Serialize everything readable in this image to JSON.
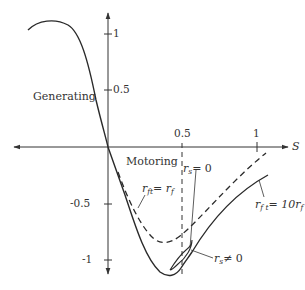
{
  "diagram": {
    "type": "torque-slip characteristic",
    "axes": {
      "x_label": "S",
      "x_ticks": [
        "0.5",
        "1"
      ],
      "y_ticks": [
        "1",
        "0.5",
        "-0.5",
        "-1"
      ]
    },
    "regions": {
      "generating": "Generating",
      "motoring": "Motoring"
    },
    "annotations": {
      "rs_zero": {
        "var": "r",
        "sub": "s",
        "rel": "= 0"
      },
      "rs_nonzero": {
        "var": "r",
        "sub": "s",
        "rel": "≠ 0"
      },
      "rft_eq_rf": {
        "var": "r",
        "sub": "ft",
        "rel": "= r",
        "sub2": "f"
      },
      "rft_eq_10rf": {
        "var": "r",
        "sub": "f t",
        "rel": "= 10r",
        "sub2": "f"
      }
    },
    "colors": {
      "line": "#2a2a2a",
      "axis": "#333333",
      "text": "#333333"
    }
  }
}
